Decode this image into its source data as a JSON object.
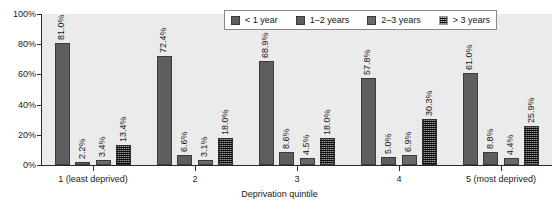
{
  "chart_data": {
    "type": "bar",
    "title": "",
    "xlabel": "Deprivation quintile",
    "ylabel": "",
    "ylim": [
      0,
      100
    ],
    "ytick_labels": [
      "0%",
      "20%",
      "40%",
      "60%",
      "80%",
      "100%"
    ],
    "ytick_values": [
      0,
      20,
      40,
      60,
      80,
      100
    ],
    "grid": false,
    "legend_position": "top-right",
    "categories": [
      "1 (least deprived)",
      "2",
      "3",
      "4",
      "5 (most deprived)"
    ],
    "series": [
      {
        "name": "< 1 year",
        "values": [
          81.0,
          72.4,
          68.9,
          57.8,
          61.0
        ],
        "labels": [
          "81.0%",
          "72.4%",
          "68.9%",
          "57.8%",
          "61.0%"
        ]
      },
      {
        "name": "1–2 years",
        "values": [
          2.2,
          6.6,
          8.6,
          5.0,
          8.8
        ],
        "labels": [
          "2.2%",
          "6.6%",
          "8.6%",
          "5.0%",
          "8.8%"
        ]
      },
      {
        "name": "2–3 years",
        "values": [
          3.4,
          3.1,
          4.5,
          6.9,
          4.4
        ],
        "labels": [
          "3.4%",
          "3.1%",
          "4.5%",
          "6.9%",
          "4.4%"
        ]
      },
      {
        "name": "> 3 years",
        "values": [
          13.4,
          18.0,
          18.0,
          30.3,
          25.9
        ],
        "labels": [
          "13.4%",
          "18.0%",
          "18.0%",
          "30.3%",
          "25.9%"
        ]
      }
    ]
  }
}
